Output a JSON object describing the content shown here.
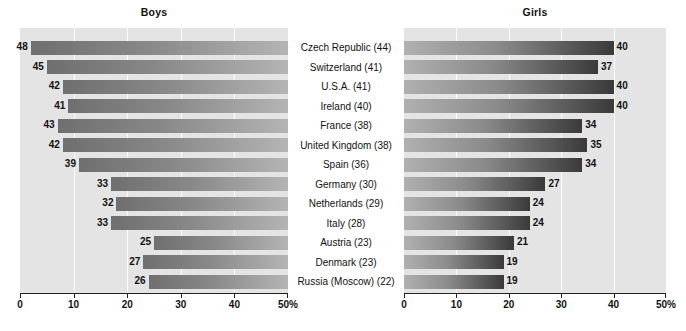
{
  "chart_data": {
    "type": "bar",
    "title": "",
    "orientation": "horizontal-diverging",
    "xlabel": "",
    "ylabel": "",
    "xlim": [
      0,
      50
    ],
    "axis_unit": "%",
    "grid": true,
    "legend_position": "none",
    "panels": [
      {
        "name": "boys",
        "title": "Boys",
        "direction": "right-to-left",
        "axis_ticks": [
          "50%",
          "40",
          "30",
          "20",
          "10",
          "0"
        ],
        "axis_tick_values": [
          50,
          40,
          30,
          20,
          10,
          0
        ]
      },
      {
        "name": "girls",
        "title": "Girls",
        "direction": "left-to-right",
        "axis_ticks": [
          "0",
          "10",
          "20",
          "30",
          "40",
          "50%"
        ],
        "axis_tick_values": [
          0,
          10,
          20,
          30,
          40,
          50
        ]
      }
    ],
    "categories": [
      "Czech Republic (44)",
      "Switzerland (41)",
      "U.S.A. (41)",
      "Ireland (40)",
      "France (38)",
      "United Kingdom (38)",
      "Spain (36)",
      "Germany (30)",
      "Netherlands (29)",
      "Italy (28)",
      "Austria (23)",
      "Denmark (23)",
      "Russia (Moscow) (22)"
    ],
    "series": [
      {
        "name": "Boys",
        "values": [
          48,
          45,
          42,
          41,
          43,
          42,
          39,
          33,
          32,
          33,
          25,
          27,
          26
        ]
      },
      {
        "name": "Girls",
        "values": [
          40,
          37,
          40,
          40,
          34,
          35,
          34,
          27,
          24,
          24,
          21,
          19,
          19
        ]
      }
    ],
    "colors": {
      "plot_background": "#e4e4e4",
      "gridline": "#fbfbfb",
      "bar_boys_dark": "#6f6f6f",
      "bar_boys_light": "#b4b4b4",
      "bar_girls_dark": "#3a3a3a",
      "bar_girls_light": "#b0b0b0",
      "axis": "#222222",
      "text": "#111111"
    }
  }
}
